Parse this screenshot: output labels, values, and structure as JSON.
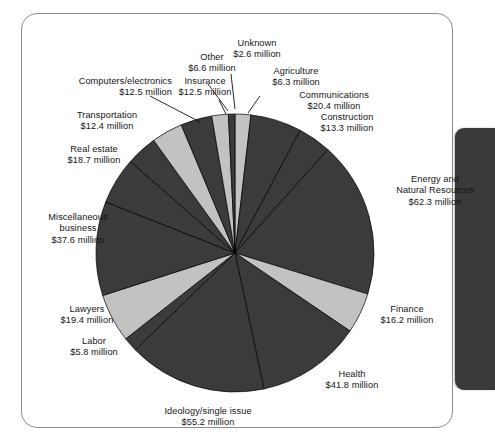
{
  "figure": {
    "frame_color": "#8d8d8d",
    "background": "#ffffff",
    "side_tab_color": "#3a3a3a"
  },
  "chart_data": {
    "type": "pie",
    "title": "",
    "subtitle": "",
    "xlabel": "",
    "ylabel": "",
    "units": "million U.S. dollars",
    "value_prefix": "$",
    "value_suffix": " million",
    "total": 343.1,
    "start_angle_deg": 0,
    "direction": "clockwise",
    "legend_position": "none",
    "grid": false,
    "colors": {
      "dark": "#3b3b3b",
      "light": "#c2c2c2",
      "outline": "#000000"
    },
    "categories": [
      "Agriculture",
      "Communications",
      "Construction",
      "Energy and Natural Resources",
      "Finance",
      "Health",
      "Ideology/single issue",
      "Labor",
      "Lawyers",
      "Miscellaneous business",
      "Real estate",
      "Transportation",
      "Computers/electronics",
      "Insurance",
      "Other",
      "Unknown"
    ],
    "values": [
      6.3,
      20.4,
      13.3,
      62.3,
      16.2,
      41.8,
      55.2,
      5.8,
      19.4,
      37.6,
      18.7,
      12.4,
      12.5,
      12.5,
      6.6,
      2.6
    ],
    "slices": [
      {
        "label": "Agriculture",
        "value": 6.3,
        "display": "$6.3 million",
        "shade": "light"
      },
      {
        "label": "Communications",
        "value": 20.4,
        "display": "$20.4 million",
        "shade": "dark"
      },
      {
        "label": "Construction",
        "value": 13.3,
        "display": "$13.3 million",
        "shade": "dark"
      },
      {
        "label": "Energy and Natural Resources",
        "value": 62.3,
        "display": "$62.3 million",
        "shade": "dark"
      },
      {
        "label": "Finance",
        "value": 16.2,
        "display": "$16.2 million",
        "shade": "light"
      },
      {
        "label": "Health",
        "value": 41.8,
        "display": "$41.8 million",
        "shade": "dark"
      },
      {
        "label": "Ideology/single issue",
        "value": 55.2,
        "display": "$55.2 million",
        "shade": "dark"
      },
      {
        "label": "Labor",
        "value": 5.8,
        "display": "$5.8 million",
        "shade": "dark"
      },
      {
        "label": "Lawyers",
        "value": 19.4,
        "display": "$19.4 million",
        "shade": "light"
      },
      {
        "label": "Miscellaneous business",
        "value": 37.6,
        "display": "$37.6 million",
        "shade": "dark"
      },
      {
        "label": "Real estate",
        "value": 18.7,
        "display": "$18.7 million",
        "shade": "dark"
      },
      {
        "label": "Transportation",
        "value": 12.4,
        "display": "$12.4 million",
        "shade": "dark"
      },
      {
        "label": "Computers/electronics",
        "value": 12.5,
        "display": "$12.5 million",
        "shade": "light"
      },
      {
        "label": "Insurance",
        "value": 12.5,
        "display": "$12.5 million",
        "shade": "dark"
      },
      {
        "label": "Other",
        "value": 6.6,
        "display": "$6.6 million",
        "shade": "light"
      },
      {
        "label": "Unknown",
        "value": 2.6,
        "display": "$2.6 million",
        "shade": "dark"
      }
    ]
  },
  "labels": {
    "unknown": {
      "name": "Unknown",
      "value": "$2.6 million"
    },
    "other": {
      "name": "Other",
      "value": "$6.6 million"
    },
    "agriculture": {
      "name": "Agriculture",
      "value": "$6.3 million"
    },
    "insurance": {
      "name": "Insurance",
      "value": "$12.5 million"
    },
    "computers": {
      "name": "Computers/electronics",
      "value": "$12.5 million"
    },
    "communications": {
      "name": "Communications",
      "value": "$20.4 million"
    },
    "transportation": {
      "name": "Transportation",
      "value": "$12.4 million"
    },
    "construction": {
      "name": "Construction",
      "value": "$13.3 million"
    },
    "realestate": {
      "name": "Real estate",
      "value": "$18.7 million"
    },
    "energy": {
      "name1": "Energy and",
      "name2": "Natural Resources",
      "value": "$62.3 million"
    },
    "misc": {
      "name1": "Miscellaneous",
      "name2": "business",
      "value": "$37.6 million"
    },
    "lawyers": {
      "name": "Lawyers",
      "value": "$19.4 million"
    },
    "finance": {
      "name": "Finance",
      "value": "$16.2 million"
    },
    "labor": {
      "name": "Labor",
      "value": "$5.8 million"
    },
    "health": {
      "name": "Health",
      "value": "$41.8 million"
    },
    "ideology": {
      "name": "Ideology/single issue",
      "value": "$55.2 million"
    }
  }
}
